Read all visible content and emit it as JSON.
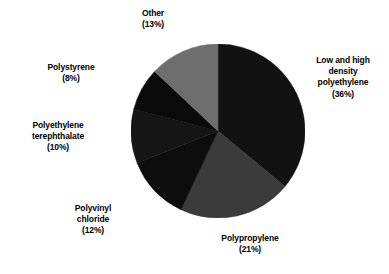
{
  "chart_data": {
    "type": "pie",
    "title": "",
    "subtitle": "",
    "xlabel": "",
    "ylabel": "",
    "grid": false,
    "legend_position": "none",
    "label_format": "name (percent%)",
    "start_angle_deg": 0,
    "direction": "clockwise",
    "categories": [
      "Low and high density polyethylene",
      "Polypropylene",
      "Polyvinyl chloride",
      "Polyethylene terephthalate",
      "Polystyrene",
      "Other"
    ],
    "values": [
      36,
      21,
      12,
      10,
      8,
      13
    ],
    "units": "percent",
    "total": 100,
    "slices": [
      {
        "name": "Low and high density polyethylene",
        "value": 36,
        "percent_text": "(36%)",
        "color": "#121212",
        "start_deg": 0,
        "end_deg": 129.6,
        "label_lines": "Low and high\ndensity\npolyethylene\n(36%)"
      },
      {
        "name": "Polypropylene",
        "value": 21,
        "percent_text": "(21%)",
        "color": "#3b3b3b",
        "start_deg": 129.6,
        "end_deg": 205.2,
        "label_lines": "Polypropylene\n(21%)"
      },
      {
        "name": "Polyvinyl chloride",
        "value": 12,
        "percent_text": "(12%)",
        "color": "#0d0d0d",
        "start_deg": 205.2,
        "end_deg": 248.4,
        "label_lines": "Polyvinyl\nchloride\n(12%)"
      },
      {
        "name": "Polyethylene terephthalate",
        "value": 10,
        "percent_text": "(10%)",
        "color": "#161616",
        "start_deg": 248.4,
        "end_deg": 284.4,
        "label_lines": "Polyethylene\nterephthalate\n(10%)"
      },
      {
        "name": "Polystyrene",
        "value": 8,
        "percent_text": "(8%)",
        "color": "#0a0a0a",
        "start_deg": 284.4,
        "end_deg": 313.2,
        "label_lines": "Polystyrene\n(8%)"
      },
      {
        "name": "Other",
        "value": 13,
        "percent_text": "(13%)",
        "color": "#6e6e6e",
        "start_deg": 313.2,
        "end_deg": 360,
        "label_lines": "Other\n(13%)"
      }
    ],
    "colors": {
      "background": "#ffffff",
      "label_text": "#000000",
      "slice_ldpe": "#121212",
      "slice_pp": "#3b3b3b",
      "slice_pvc": "#0d0d0d",
      "slice_pet": "#161616",
      "slice_ps": "#0a0a0a",
      "slice_other": "#6e6e6e"
    }
  },
  "labels": {
    "other": "Other\n(13%)",
    "ldpe": "Low and high\ndensity\npolyethylene\n(36%)",
    "polystyrene": "Polystyrene\n(8%)",
    "pet": "Polyethylene\nterephthalate\n(10%)",
    "pvc": "Polyvinyl\nchloride\n(12%)",
    "polypropylene": "Polypropylene\n(21%)"
  }
}
